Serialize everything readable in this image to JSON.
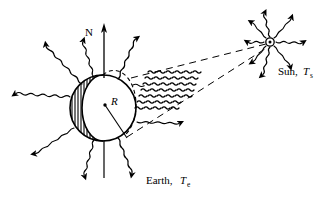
{
  "figure": {
    "kind": "physics-diagram",
    "background_color": "#ffffff",
    "ink_color": "#000000",
    "width": 327,
    "height": 204
  },
  "labels": {
    "north_axis": "N",
    "radius": "R",
    "sun_name": "Sun,",
    "sun_symbol": "T",
    "sun_subscript": "s",
    "earth_name": "Earth,",
    "earth_symbol": "T",
    "earth_subscript": "e"
  },
  "earth": {
    "center_x": 103,
    "center_y": 108,
    "radius": 33,
    "shaded_side": "left",
    "hatch_count": 13,
    "axis_label": "N",
    "radius_label": "R",
    "emitted_ray_count": 9
  },
  "sun": {
    "center_x": 270,
    "center_y": 42,
    "core_radius": 4,
    "ray_count": 8
  },
  "beam": {
    "wave_rows": 7,
    "waves_per_row": 6,
    "dashed_edge_lines": 2
  }
}
